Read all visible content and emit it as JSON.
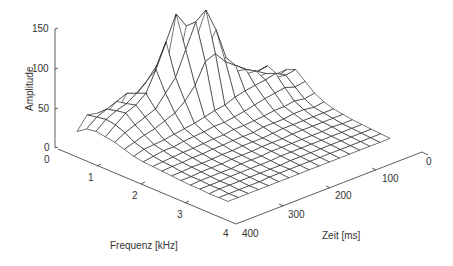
{
  "chart_data": {
    "type": "surface3d",
    "title": "",
    "xlabel": "Frequenz [kHz]",
    "ylabel": "Zeit [ms]",
    "zlabel": "Amplitude",
    "x_ticks": [
      "0",
      "1",
      "2",
      "3",
      "4"
    ],
    "y_ticks": [
      "0",
      "100",
      "200",
      "300",
      "400"
    ],
    "z_ticks": [
      "0",
      "50",
      "100",
      "150"
    ],
    "xlim": [
      0,
      4
    ],
    "ylim": [
      0,
      400
    ],
    "zlim": [
      0,
      150
    ],
    "grid": false,
    "style": "wireframe mesh, black lines on white",
    "frequency_kHz": [
      0,
      0.25,
      0.5,
      0.75,
      1,
      1.25,
      1.5,
      1.75,
      2,
      2.25,
      2.5,
      2.75,
      3,
      3.25,
      3.5,
      3.75,
      4
    ],
    "time_ms": [
      0,
      25,
      50,
      75,
      100,
      125,
      150,
      175,
      200,
      225,
      250,
      275,
      300,
      325,
      350,
      375,
      400
    ],
    "amplitude_rows_by_time": [
      [
        8,
        12,
        18,
        30,
        25,
        35,
        40,
        30,
        20,
        14,
        10,
        8,
        6,
        5,
        4,
        3,
        2
      ],
      [
        8,
        14,
        20,
        28,
        22,
        30,
        38,
        28,
        18,
        12,
        10,
        8,
        6,
        5,
        4,
        3,
        2
      ],
      [
        10,
        16,
        22,
        35,
        30,
        40,
        45,
        32,
        20,
        14,
        10,
        8,
        7,
        5,
        4,
        3,
        2
      ],
      [
        10,
        18,
        30,
        45,
        40,
        48,
        42,
        30,
        18,
        14,
        10,
        8,
        6,
        5,
        4,
        3,
        2
      ],
      [
        12,
        20,
        35,
        50,
        48,
        55,
        40,
        28,
        18,
        12,
        10,
        8,
        6,
        5,
        4,
        3,
        2
      ],
      [
        12,
        22,
        38,
        60,
        70,
        65,
        38,
        25,
        16,
        12,
        10,
        8,
        6,
        5,
        4,
        3,
        2
      ],
      [
        14,
        25,
        45,
        80,
        110,
        75,
        35,
        22,
        15,
        12,
        9,
        7,
        6,
        5,
        4,
        3,
        2
      ],
      [
        14,
        28,
        55,
        100,
        140,
        90,
        30,
        20,
        14,
        10,
        8,
        7,
        6,
        5,
        4,
        3,
        2
      ],
      [
        15,
        30,
        60,
        120,
        130,
        85,
        28,
        18,
        14,
        10,
        8,
        7,
        6,
        5,
        4,
        3,
        2
      ],
      [
        15,
        32,
        70,
        140,
        100,
        60,
        25,
        18,
        12,
        10,
        8,
        6,
        5,
        4,
        3,
        3,
        2
      ],
      [
        16,
        35,
        75,
        110,
        70,
        45,
        22,
        16,
        12,
        9,
        7,
        6,
        5,
        4,
        3,
        3,
        2
      ],
      [
        18,
        40,
        60,
        80,
        55,
        35,
        20,
        15,
        11,
        9,
        7,
        6,
        5,
        4,
        3,
        3,
        2
      ],
      [
        20,
        45,
        50,
        55,
        40,
        30,
        18,
        14,
        10,
        8,
        6,
        5,
        4,
        4,
        3,
        2,
        2
      ],
      [
        22,
        40,
        42,
        45,
        35,
        25,
        16,
        12,
        10,
        8,
        6,
        5,
        4,
        4,
        3,
        2,
        2
      ],
      [
        25,
        35,
        38,
        40,
        30,
        22,
        15,
        12,
        9,
        7,
        6,
        5,
        4,
        3,
        3,
        2,
        2
      ],
      [
        28,
        30,
        32,
        30,
        25,
        18,
        14,
        10,
        8,
        7,
        5,
        4,
        4,
        3,
        3,
        2,
        2
      ],
      [
        12,
        20,
        22,
        20,
        18,
        14,
        10,
        8,
        7,
        6,
        5,
        4,
        3,
        3,
        2,
        2,
        2
      ]
    ],
    "peak_amplitude_approx": 145,
    "peak_location_approx": {
      "frequency_kHz": 1.0,
      "time_ms": 200
    }
  }
}
